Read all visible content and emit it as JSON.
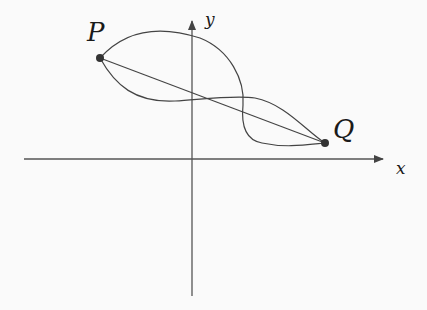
{
  "diagram": {
    "points": [
      {
        "label": "P",
        "x": 100,
        "y": 58
      },
      {
        "label": "Q",
        "x": 325,
        "y": 143
      }
    ],
    "axes": {
      "x_label": "x",
      "y_label": "y"
    },
    "colors": {
      "stroke": "#444444",
      "point": "#333333",
      "background": "#fafafa"
    }
  }
}
